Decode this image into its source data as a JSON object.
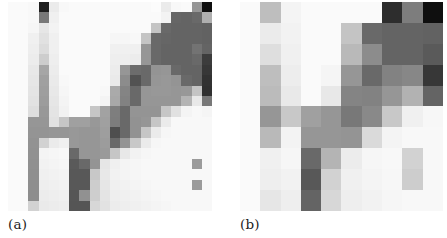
{
  "figure": {
    "type": "two-panel-grayscale-heatmap-figure",
    "background_color": "#ffffff",
    "panels": [
      {
        "id": "a",
        "caption": "(a)",
        "rows": 20,
        "cols": 20,
        "cell_px": 10.2
      },
      {
        "id": "b",
        "caption": "(b)",
        "rows": 10,
        "cols": 10,
        "cell_px": 20.3
      }
    ]
  },
  "chart_data": [
    {
      "type": "heatmap",
      "id": "panel-a",
      "title": "(a)",
      "xlabel": "",
      "ylabel": "",
      "colormap": "grayscale",
      "vmin": 0,
      "vmax": 255,
      "note": "Pixel intensity values 0 (black) to 255 (white); 20 rows x 20 columns",
      "rows": 20,
      "cols": 20,
      "values": [
        [
          250,
          250,
          248,
          30,
          235,
          248,
          250,
          250,
          250,
          250,
          250,
          250,
          250,
          250,
          252,
          235,
          248,
          250,
          150,
          15
        ],
        [
          250,
          250,
          248,
          120,
          240,
          250,
          250,
          250,
          250,
          250,
          250,
          250,
          250,
          250,
          250,
          243,
          102,
          100,
          105,
          175
        ],
        [
          250,
          250,
          246,
          230,
          243,
          250,
          250,
          250,
          250,
          250,
          250,
          250,
          250,
          250,
          196,
          105,
          100,
          100,
          100,
          98
        ],
        [
          250,
          250,
          240,
          225,
          240,
          250,
          250,
          250,
          250,
          250,
          246,
          246,
          248,
          196,
          105,
          102,
          100,
          100,
          100,
          98
        ],
        [
          250,
          250,
          238,
          220,
          240,
          250,
          250,
          250,
          250,
          250,
          240,
          240,
          240,
          150,
          105,
          100,
          100,
          100,
          115,
          100
        ],
        [
          250,
          250,
          236,
          205,
          238,
          250,
          250,
          250,
          250,
          250,
          238,
          238,
          236,
          150,
          105,
          100,
          100,
          100,
          105,
          60
        ],
        [
          250,
          250,
          232,
          166,
          236,
          250,
          250,
          250,
          250,
          250,
          236,
          150,
          108,
          105,
          148,
          150,
          105,
          100,
          100,
          55
        ],
        [
          250,
          250,
          230,
          160,
          234,
          248,
          250,
          250,
          250,
          250,
          234,
          140,
          82,
          105,
          150,
          152,
          148,
          105,
          100,
          50
        ],
        [
          250,
          250,
          228,
          158,
          232,
          246,
          250,
          250,
          250,
          248,
          170,
          132,
          105,
          150,
          152,
          152,
          150,
          152,
          196,
          48
        ],
        [
          250,
          250,
          226,
          156,
          230,
          244,
          250,
          250,
          250,
          244,
          168,
          130,
          105,
          150,
          150,
          150,
          150,
          180,
          232,
          120
        ],
        [
          250,
          250,
          222,
          152,
          228,
          242,
          250,
          250,
          198,
          162,
          126,
          105,
          148,
          148,
          148,
          198,
          225,
          244,
          248,
          245
        ],
        [
          250,
          250,
          150,
          150,
          226,
          198,
          160,
          160,
          152,
          160,
          125,
          105,
          146,
          150,
          198,
          235,
          248,
          248,
          248,
          248
        ],
        [
          250,
          250,
          148,
          148,
          150,
          150,
          152,
          150,
          150,
          158,
          78,
          105,
          146,
          198,
          235,
          246,
          248,
          248,
          248,
          248
        ],
        [
          250,
          250,
          146,
          210,
          235,
          240,
          152,
          150,
          150,
          156,
          105,
          148,
          200,
          235,
          246,
          248,
          248,
          248,
          248,
          248
        ],
        [
          250,
          250,
          145,
          244,
          246,
          248,
          105,
          150,
          150,
          154,
          198,
          232,
          242,
          246,
          248,
          248,
          248,
          248,
          248,
          248
        ],
        [
          250,
          250,
          144,
          242,
          244,
          246,
          90,
          105,
          148,
          230,
          240,
          244,
          246,
          248,
          248,
          248,
          248,
          248,
          155,
          248
        ],
        [
          250,
          250,
          143,
          240,
          242,
          244,
          88,
          88,
          200,
          232,
          242,
          244,
          246,
          248,
          248,
          248,
          248,
          248,
          248,
          248
        ],
        [
          250,
          250,
          142,
          238,
          240,
          242,
          88,
          88,
          205,
          230,
          240,
          242,
          244,
          246,
          248,
          248,
          248,
          248,
          155,
          248
        ],
        [
          250,
          250,
          141,
          236,
          238,
          240,
          86,
          145,
          206,
          228,
          238,
          240,
          242,
          244,
          246,
          248,
          248,
          248,
          248,
          248
        ],
        [
          250,
          250,
          210,
          234,
          236,
          238,
          85,
          85,
          215,
          226,
          236,
          238,
          240,
          242,
          244,
          246,
          248,
          248,
          248,
          248
        ]
      ]
    },
    {
      "type": "heatmap",
      "id": "panel-b",
      "title": "(b)",
      "xlabel": "",
      "ylabel": "",
      "colormap": "grayscale",
      "vmin": 0,
      "vmax": 255,
      "note": "2x2 block-averaged (downsampled) version of panel (a); 10 rows x 10 columns",
      "rows": 10,
      "cols": 10,
      "values": [
        [
          250,
          190,
          244,
          250,
          250,
          250,
          250,
          45,
          125,
          15
        ],
        [
          250,
          235,
          242,
          250,
          250,
          196,
          105,
          100,
          100,
          98
        ],
        [
          250,
          222,
          240,
          250,
          250,
          185,
          140,
          100,
          100,
          90
        ],
        [
          250,
          190,
          237,
          250,
          245,
          150,
          105,
          130,
          135,
          55
        ],
        [
          250,
          187,
          233,
          250,
          232,
          132,
          130,
          150,
          178,
          100
        ],
        [
          250,
          150,
          200,
          160,
          150,
          120,
          137,
          200,
          240,
          247
        ],
        [
          250,
          185,
          243,
          150,
          150,
          148,
          218,
          244,
          248,
          248
        ],
        [
          250,
          240,
          246,
          105,
          180,
          236,
          246,
          248,
          210,
          248
        ],
        [
          250,
          238,
          242,
          88,
          210,
          240,
          244,
          247,
          205,
          248
        ],
        [
          250,
          230,
          238,
          100,
          215,
          238,
          242,
          246,
          248,
          248
        ]
      ]
    }
  ],
  "captions": {
    "panel_a": "(a)",
    "panel_b": "(b)"
  }
}
